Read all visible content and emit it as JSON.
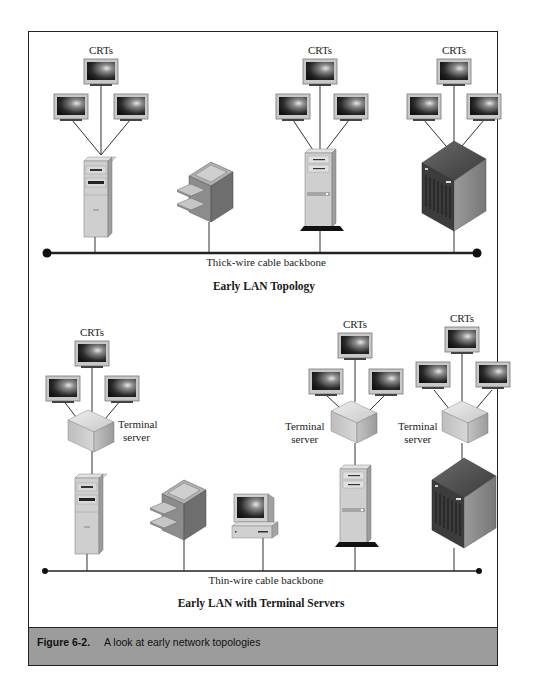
{
  "figure": {
    "number": "Figure 6-2.",
    "caption": "A look at early network topologies"
  },
  "top_diagram": {
    "title": "Early LAN Topology",
    "backbone_label": "Thick-wire cable backbone",
    "groups": [
      {
        "label": "CRTs",
        "host": "tower-server"
      },
      {
        "label": "CRTs",
        "host": "tower-server"
      },
      {
        "label": "CRTs",
        "host": "mainframe"
      }
    ],
    "devices": [
      "tower-server",
      "printer",
      "tower-server",
      "mainframe"
    ]
  },
  "bottom_diagram": {
    "title": "Early LAN with Terminal Servers",
    "backbone_label": "Thin-wire cable backbone",
    "groups": [
      {
        "label": "CRTs",
        "terminal_server_label": "Terminal server",
        "host": "tower-server"
      },
      {
        "label": "CRTs",
        "terminal_server_label": "Terminal server",
        "host": "tower-server"
      },
      {
        "label": "CRTs",
        "terminal_server_label": "Terminal server",
        "host": "mainframe"
      }
    ],
    "devices": [
      "tower-server",
      "printer",
      "desktop-pc",
      "tower-server",
      "mainframe"
    ],
    "terminal_server_line1": "Terminal",
    "terminal_server_line2": "server"
  },
  "colors": {
    "border": "#222222",
    "caption_bar": "#9c9c9c",
    "device_light": "#d4d4d4",
    "device_mid": "#a8a8a8",
    "device_dark": "#555555",
    "screen_dark": "#1c1c1c"
  }
}
